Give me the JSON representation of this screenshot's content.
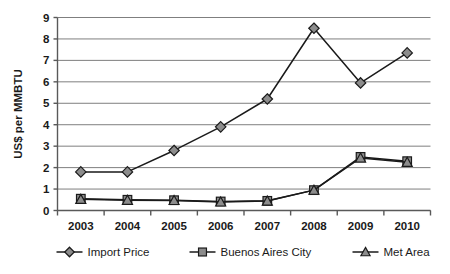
{
  "chart_data": {
    "type": "line",
    "title": "",
    "xlabel": "",
    "ylabel": "US$ per MMBTU",
    "categories": [
      "2003",
      "2004",
      "2005",
      "2006",
      "2007",
      "2008",
      "2009",
      "2010"
    ],
    "x": [
      2003,
      2004,
      2005,
      2006,
      2007,
      2008,
      2009,
      2010
    ],
    "ylim": [
      0,
      9
    ],
    "ytick_labels": [
      "0",
      "1",
      "2",
      "3",
      "4",
      "5",
      "6",
      "7",
      "8",
      "9"
    ],
    "ytick_values": [
      0,
      1,
      2,
      3,
      4,
      5,
      6,
      7,
      8,
      9
    ],
    "grid": "horizontal",
    "legend_position": "bottom",
    "series": [
      {
        "name": "Import Price",
        "marker": "diamond",
        "values": [
          1.8,
          1.8,
          2.8,
          3.9,
          5.2,
          8.5,
          5.95,
          7.35
        ]
      },
      {
        "name": "Buenos Aires City",
        "marker": "square",
        "values": [
          0.55,
          0.5,
          0.48,
          0.42,
          0.45,
          0.95,
          2.5,
          2.3
        ]
      },
      {
        "name": "Met Area",
        "marker": "triangle",
        "values": [
          0.52,
          0.48,
          0.47,
          0.4,
          0.44,
          0.95,
          2.45,
          2.25
        ]
      }
    ],
    "colors": {
      "line": "#1a1a1a",
      "marker_fill": "#8c8c8c",
      "marker_stroke": "#1a1a1a",
      "grid": "#7f7f7f",
      "axis": "#595959",
      "background": "#ffffff",
      "text": "#1a1a1a"
    }
  },
  "legend": {
    "items": [
      {
        "label": "Import Price",
        "marker": "diamond"
      },
      {
        "label": "Buenos Aires City",
        "marker": "square"
      },
      {
        "label": "Met Area",
        "marker": "triangle"
      }
    ]
  }
}
